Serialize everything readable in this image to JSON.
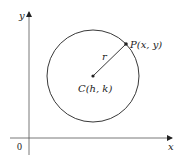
{
  "diagram": {
    "axes": {
      "x_label": "x",
      "y_label": "y",
      "origin_label": "0"
    },
    "circle": {
      "center_label": "C(h, k)",
      "point_label": "P(x, y)",
      "radius_label": "r"
    },
    "colors": {
      "stroke": "#222222",
      "background": "#ffffff"
    }
  }
}
